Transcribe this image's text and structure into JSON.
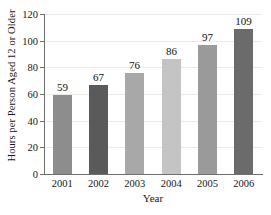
{
  "chart_data": {
    "type": "bar",
    "title": "",
    "xlabel": "Year",
    "ylabel": "Hours per Person Aged 12 or Older",
    "categories": [
      "2001",
      "2002",
      "2003",
      "2004",
      "2005",
      "2006"
    ],
    "values": [
      59,
      67,
      76,
      86,
      97,
      109
    ],
    "value_labels": [
      "59",
      "67",
      "76",
      "86",
      "97",
      "109"
    ],
    "bar_colors": [
      "#8d8d8d",
      "#5a5a5a",
      "#a8a8a8",
      "#c4c4c4",
      "#9a9a9a",
      "#6b6b6b"
    ],
    "ylim": [
      0,
      120
    ],
    "yticks": [
      0,
      20,
      40,
      60,
      80,
      100,
      120
    ],
    "ytick_labels": [
      "0",
      "20",
      "40",
      "60",
      "80",
      "100",
      "120"
    ],
    "grid": true,
    "grid_axis": "y",
    "grid_color": "#e9e9e9",
    "legend": false,
    "legend_position": "none",
    "axis_color": "#6e6e6e",
    "text_color": "#161616",
    "background": "#ffffff"
  }
}
